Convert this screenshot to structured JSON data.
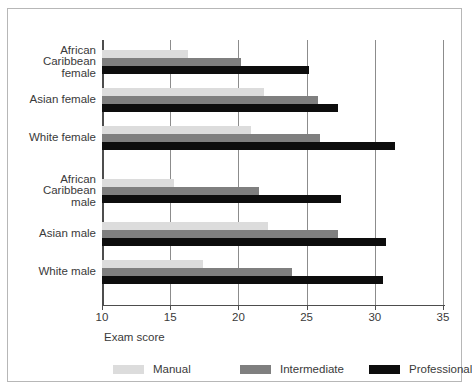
{
  "chart_data": {
    "type": "bar",
    "orientation": "horizontal",
    "title": "",
    "xlabel": "Exam score",
    "ylabel": "",
    "xlim": [
      10,
      35
    ],
    "xticks": [
      10,
      15,
      20,
      25,
      30,
      35
    ],
    "xtick_labels": [
      "10",
      "15",
      "20",
      "25",
      "30",
      "35"
    ],
    "grid": true,
    "grid_axis": "x",
    "legend_position": "bottom",
    "categories": [
      "African\nCaribbean\nfemale",
      "Asian female",
      "White female",
      "African\nCaribbean\nmale",
      "Asian male",
      "White male"
    ],
    "series": [
      {
        "name": "Manual",
        "color": "#dcdcdc",
        "values": [
          16.3,
          21.9,
          20.9,
          15.3,
          22.2,
          17.4
        ]
      },
      {
        "name": "Intermediate",
        "color": "#7f7f7f",
        "values": [
          20.2,
          25.8,
          26.0,
          21.5,
          27.3,
          23.9
        ]
      },
      {
        "name": "Professional",
        "color": "#0d0d0d",
        "values": [
          25.2,
          27.3,
          31.5,
          27.5,
          30.8,
          30.6
        ]
      }
    ]
  },
  "legend": {
    "items": [
      {
        "label": "Manual",
        "swatch": "manual-swatch"
      },
      {
        "label": "Intermediate",
        "swatch": "intermediate-swatch"
      },
      {
        "label": "Professional",
        "swatch": "professional-swatch"
      }
    ]
  }
}
